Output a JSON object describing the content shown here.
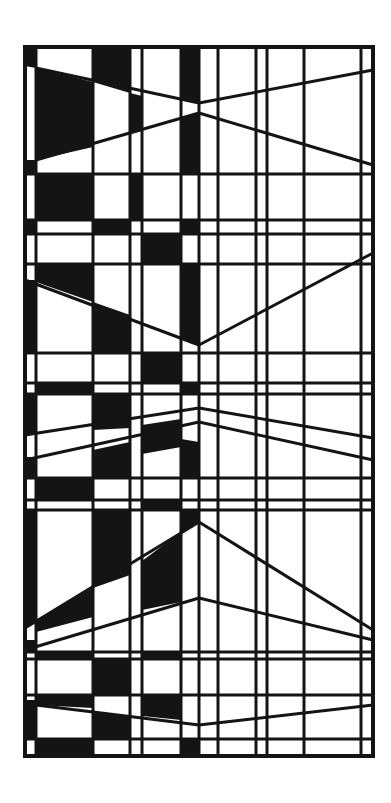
{
  "artwork": {
    "width": 391,
    "height": 803,
    "background": "#ffffff",
    "ink": "#141414",
    "stroke_width": 3,
    "frame": {
      "x1": 25,
      "y1": 47,
      "x2": 373,
      "y2": 756
    },
    "verticals": [
      36,
      93,
      130,
      142,
      181,
      199,
      218,
      256,
      267,
      304,
      361
    ],
    "horizontals": [
      174,
      220,
      234,
      264,
      353,
      383,
      394,
      478,
      500,
      510,
      652,
      659,
      695,
      739
    ],
    "diagonals": [
      [
        36,
        68,
        199,
        103
      ],
      [
        199,
        103,
        373,
        70
      ],
      [
        36,
        160,
        199,
        113
      ],
      [
        199,
        113,
        373,
        165
      ],
      [
        25,
        280,
        199,
        345
      ],
      [
        199,
        345,
        373,
        253
      ],
      [
        25,
        435,
        199,
        408
      ],
      [
        199,
        408,
        373,
        438
      ],
      [
        25,
        460,
        199,
        422
      ],
      [
        199,
        422,
        373,
        460
      ],
      [
        25,
        628,
        199,
        522
      ],
      [
        199,
        522,
        373,
        630
      ],
      [
        25,
        650,
        199,
        598
      ],
      [
        199,
        598,
        373,
        640
      ],
      [
        36,
        705,
        199,
        725
      ],
      [
        199,
        725,
        373,
        705
      ]
    ],
    "fills": [
      [
        [
          25,
          47
        ],
        [
          36,
          47
        ],
        [
          36,
          68
        ],
        [
          25,
          66
        ]
      ],
      [
        [
          36,
          68
        ],
        [
          93,
          82
        ],
        [
          93,
          147
        ],
        [
          36,
          160
        ]
      ],
      [
        [
          93,
          47
        ],
        [
          130,
          47
        ],
        [
          130,
          93
        ],
        [
          93,
          82
        ]
      ],
      [
        [
          130,
          93
        ],
        [
          142,
          96
        ],
        [
          142,
          131
        ],
        [
          130,
          134
        ]
      ],
      [
        [
          181,
          47
        ],
        [
          199,
          47
        ],
        [
          199,
          103
        ],
        [
          181,
          99
        ]
      ],
      [
        [
          181,
          118
        ],
        [
          199,
          113
        ],
        [
          199,
          174
        ],
        [
          181,
          174
        ]
      ],
      [
        [
          25,
          160
        ],
        [
          36,
          160
        ],
        [
          36,
          174
        ],
        [
          25,
          174
        ]
      ],
      [
        [
          36,
          174
        ],
        [
          93,
          174
        ],
        [
          93,
          220
        ],
        [
          36,
          220
        ]
      ],
      [
        [
          130,
          174
        ],
        [
          142,
          174
        ],
        [
          142,
          220
        ],
        [
          130,
          220
        ]
      ],
      [
        [
          25,
          220
        ],
        [
          36,
          220
        ],
        [
          36,
          234
        ],
        [
          25,
          234
        ]
      ],
      [
        [
          93,
          220
        ],
        [
          130,
          220
        ],
        [
          130,
          234
        ],
        [
          93,
          234
        ]
      ],
      [
        [
          181,
          220
        ],
        [
          199,
          220
        ],
        [
          199,
          234
        ],
        [
          181,
          234
        ]
      ],
      [
        [
          142,
          234
        ],
        [
          181,
          234
        ],
        [
          181,
          264
        ],
        [
          142,
          264
        ]
      ],
      [
        [
          36,
          264
        ],
        [
          93,
          264
        ],
        [
          93,
          302
        ],
        [
          36,
          282
        ]
      ],
      [
        [
          25,
          280
        ],
        [
          36,
          280
        ],
        [
          36,
          353
        ],
        [
          25,
          353
        ]
      ],
      [
        [
          93,
          302
        ],
        [
          130,
          315
        ],
        [
          130,
          353
        ],
        [
          93,
          353
        ]
      ],
      [
        [
          181,
          264
        ],
        [
          199,
          264
        ],
        [
          199,
          345
        ],
        [
          181,
          338
        ]
      ],
      [
        [
          142,
          353
        ],
        [
          181,
          353
        ],
        [
          181,
          383
        ],
        [
          142,
          383
        ]
      ],
      [
        [
          36,
          383
        ],
        [
          93,
          383
        ],
        [
          93,
          394
        ],
        [
          36,
          394
        ]
      ],
      [
        [
          181,
          383
        ],
        [
          199,
          383
        ],
        [
          199,
          394
        ],
        [
          181,
          394
        ]
      ],
      [
        [
          25,
          394
        ],
        [
          36,
          394
        ],
        [
          36,
          434
        ],
        [
          25,
          435
        ]
      ],
      [
        [
          93,
          394
        ],
        [
          130,
          394
        ],
        [
          130,
          428
        ],
        [
          93,
          430
        ]
      ],
      [
        [
          142,
          425
        ],
        [
          181,
          419
        ],
        [
          181,
          447
        ],
        [
          142,
          454
        ]
      ],
      [
        [
          25,
          457
        ],
        [
          36,
          457
        ],
        [
          36,
          478
        ],
        [
          25,
          478
        ]
      ],
      [
        [
          93,
          450
        ],
        [
          130,
          442
        ],
        [
          130,
          478
        ],
        [
          93,
          478
        ]
      ],
      [
        [
          181,
          439
        ],
        [
          199,
          442
        ],
        [
          199,
          478
        ],
        [
          181,
          478
        ]
      ],
      [
        [
          36,
          478
        ],
        [
          93,
          478
        ],
        [
          93,
          500
        ],
        [
          36,
          500
        ]
      ],
      [
        [
          142,
          500
        ],
        [
          181,
          500
        ],
        [
          181,
          510
        ],
        [
          142,
          510
        ]
      ],
      [
        [
          25,
          510
        ],
        [
          36,
          510
        ],
        [
          36,
          620
        ],
        [
          25,
          628
        ]
      ],
      [
        [
          93,
          510
        ],
        [
          130,
          510
        ],
        [
          130,
          575
        ],
        [
          93,
          588
        ]
      ],
      [
        [
          181,
          510
        ],
        [
          199,
          510
        ],
        [
          199,
          522
        ],
        [
          181,
          532
        ]
      ],
      [
        [
          36,
          620
        ],
        [
          93,
          588
        ],
        [
          93,
          617
        ],
        [
          36,
          632
        ]
      ],
      [
        [
          142,
          561
        ],
        [
          181,
          532
        ],
        [
          181,
          602
        ],
        [
          142,
          610
        ]
      ],
      [
        [
          25,
          640
        ],
        [
          36,
          640
        ],
        [
          36,
          652
        ],
        [
          25,
          652
        ]
      ],
      [
        [
          36,
          652
        ],
        [
          93,
          652
        ],
        [
          93,
          659
        ],
        [
          36,
          659
        ]
      ],
      [
        [
          93,
          659
        ],
        [
          130,
          659
        ],
        [
          130,
          695
        ],
        [
          93,
          695
        ]
      ],
      [
        [
          142,
          652
        ],
        [
          181,
          652
        ],
        [
          181,
          659
        ],
        [
          142,
          659
        ]
      ],
      [
        [
          36,
          695
        ],
        [
          93,
          695
        ],
        [
          93,
          708
        ],
        [
          36,
          705
        ]
      ],
      [
        [
          25,
          700
        ],
        [
          36,
          700
        ],
        [
          36,
          739
        ],
        [
          25,
          739
        ]
      ],
      [
        [
          142,
          695
        ],
        [
          181,
          695
        ],
        [
          181,
          720
        ],
        [
          142,
          716
        ]
      ],
      [
        [
          36,
          739
        ],
        [
          93,
          739
        ],
        [
          93,
          756
        ],
        [
          36,
          756
        ]
      ],
      [
        [
          181,
          739
        ],
        [
          199,
          739
        ],
        [
          199,
          756
        ],
        [
          181,
          756
        ]
      ],
      [
        [
          93,
          712
        ],
        [
          130,
          716
        ],
        [
          130,
          739
        ],
        [
          93,
          739
        ]
      ]
    ]
  }
}
